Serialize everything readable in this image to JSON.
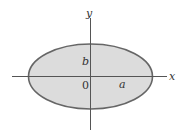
{
  "diagram": {
    "type": "ellipse-on-axes",
    "labels": {
      "x_axis": "x",
      "y_axis": "y",
      "semi_minor": "b",
      "origin": "0",
      "semi_major": "a"
    },
    "colors": {
      "fill": "#d9d9d9",
      "stroke": "#666666",
      "axis": "#555555"
    }
  }
}
